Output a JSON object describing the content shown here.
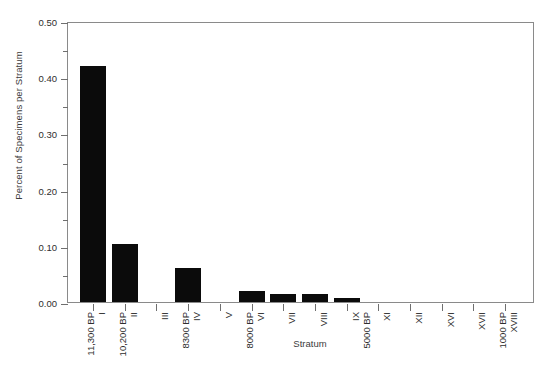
{
  "chart_data": {
    "type": "bar",
    "title": "",
    "xlabel": "Stratum",
    "ylabel": "Percent of Specimens per Stratum",
    "categories": [
      "I",
      "II",
      "III",
      "IV",
      "V",
      "VI",
      "VII",
      "VIII",
      "IX",
      "XI",
      "XII",
      "XVI",
      "XVII",
      "XVIII"
    ],
    "values": [
      0.42,
      0.104,
      0.0,
      0.06,
      0.0,
      0.02,
      0.015,
      0.015,
      0.007,
      0.0,
      0.0,
      0.0,
      0.0,
      0.0
    ],
    "ylim": [
      0.0,
      0.5
    ],
    "ytick_labels": [
      "0.00",
      "0.10",
      "0.20",
      "0.30",
      "0.40",
      "0.50"
    ],
    "ytick_values": [
      0.0,
      0.1,
      0.2,
      0.3,
      0.4,
      0.5
    ],
    "yminor_values": [
      0.05,
      0.15,
      0.25,
      0.35,
      0.45
    ],
    "grid": false,
    "legend": "none",
    "bar_color": "#0b0b0b",
    "axis_color": "#8a8a8a",
    "annotations": [
      {
        "label": "11,300 BP",
        "near_category": "I"
      },
      {
        "label": "10,200 BP",
        "near_category": "II"
      },
      {
        "label": "8300 BP",
        "near_category": "IV"
      },
      {
        "label": "8000 BP",
        "near_category": "VI"
      },
      {
        "label": "5000 BP",
        "near_category": "IX"
      },
      {
        "label": "1000 BP",
        "near_category": "XVIII"
      }
    ]
  }
}
